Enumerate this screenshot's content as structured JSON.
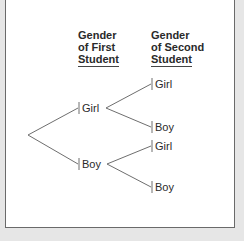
{
  "diagram": {
    "type": "tree",
    "headers": [
      {
        "lines": [
          "Gender",
          "of First",
          "Student"
        ]
      },
      {
        "lines": [
          "Gender",
          "of Second",
          "Student"
        ]
      }
    ],
    "level1": [
      {
        "label": "Girl"
      },
      {
        "label": "Boy"
      }
    ],
    "level2": [
      {
        "parent": "Girl",
        "label": "Girl"
      },
      {
        "parent": "Girl",
        "label": "Boy"
      },
      {
        "parent": "Boy",
        "label": "Girl"
      },
      {
        "parent": "Boy",
        "label": "Boy"
      }
    ]
  },
  "colors": {
    "line": "#6e6e6e",
    "text": "#2a2a2a",
    "panel_border": "#6a6a6a",
    "background": "#e6e6e6"
  }
}
